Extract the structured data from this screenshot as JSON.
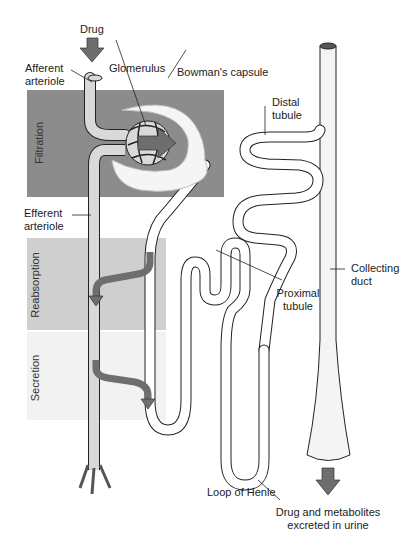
{
  "diagram": {
    "type": "nephron drug excretion diagram",
    "colors": {
      "filtration_band": "#8c8c8c",
      "reabsorption_band": "#cfcfcf",
      "secretion_band": "#f2f2f2",
      "arrow": "#6e6e6e",
      "vessel_fill": "#d9d9d9",
      "tubule_fill": "#ffffff",
      "outline": "#222222"
    }
  },
  "labels": {
    "drug": "Drug",
    "afferent": "Afferent\narteriole",
    "afferent_l1": "Afferent",
    "afferent_l2": "arteriole",
    "glomerulus": "Glomerulus",
    "bowmans": "Bowman's capsule",
    "distal_l1": "Distal",
    "distal_l2": "tubule",
    "efferent_l1": "Efferent",
    "efferent_l2": "arteriole",
    "proximal_l1": "Proximal",
    "proximal_l2": "tubule",
    "collecting_l1": "Collecting",
    "collecting_l2": "duct",
    "loop": "Loop of Henle",
    "excreted_l1": "Drug and metabolites",
    "excreted_l2": "excreted in urine"
  },
  "zones": {
    "filtration": "Filtration",
    "reabsorption": "Reabsorption",
    "secretion": "Secretion"
  }
}
